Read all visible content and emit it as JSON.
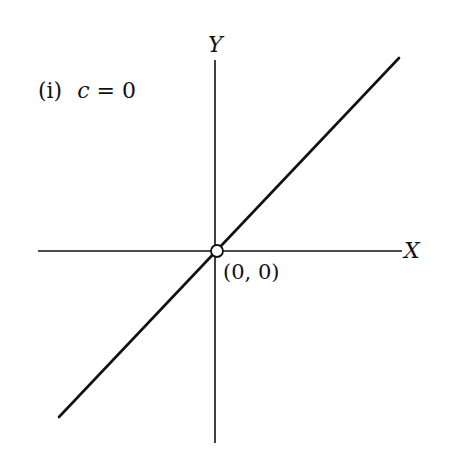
{
  "diagram": {
    "title": "(i) c = 0",
    "title_parts": {
      "roman": "(i)",
      "var": "c",
      "eq": " = 0"
    },
    "axes": {
      "x_label": "X",
      "y_label": "Y"
    },
    "origin_label": "(0, 0)",
    "line": {
      "equation": "y = x",
      "c": 0,
      "description": "Straight line through the origin with slope 1"
    },
    "colors": {
      "stroke": "#111111",
      "background": "#ffffff"
    }
  }
}
